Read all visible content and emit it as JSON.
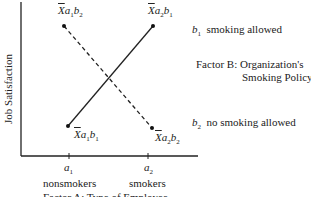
{
  "diagram": {
    "type": "interaction-plot",
    "y_axis_label": "Job Satisfaction",
    "x_axis": {
      "ticks": [
        {
          "symbol": "a",
          "sub": "1",
          "label": "nonsmokers"
        },
        {
          "symbol": "a",
          "sub": "2",
          "label": "smokers"
        }
      ],
      "factor_label": "Factor A: Type of Employee"
    },
    "points": {
      "a1b2": {
        "x": "X̄a",
        "s1": "1",
        "m": "b",
        "s2": "2"
      },
      "a2b1": {
        "x": "X̄a",
        "s1": "2",
        "m": "b",
        "s2": "1"
      },
      "a1b1": {
        "x": "X̄a",
        "s1": "1",
        "m": "b",
        "s2": "1"
      },
      "a2b2": {
        "x": "X̄a",
        "s1": "2",
        "m": "b",
        "s2": "2"
      }
    },
    "legend": {
      "b1": {
        "symbol": "b",
        "sub": "1",
        "text": "smoking allowed",
        "line": "solid"
      },
      "b2": {
        "symbol": "b",
        "sub": "2",
        "text": "no smoking allowed",
        "line": "dashed"
      },
      "factor_line1": "Factor B: Organization's",
      "factor_line2": "Smoking Policy"
    }
  }
}
